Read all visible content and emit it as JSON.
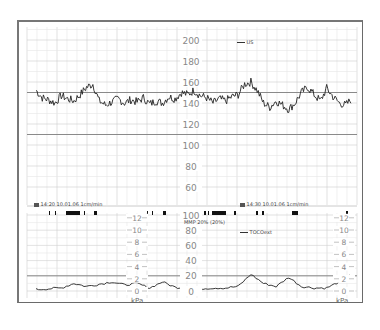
{
  "window": {
    "title": "CTG trace"
  },
  "upper_panel": {
    "legend_label": "US",
    "scale_labels": [
      "200",
      "180",
      "160",
      "140",
      "120",
      "100",
      "80",
      "60"
    ],
    "reference_lines": [
      150,
      110
    ]
  },
  "lower_panel": {
    "header_left": "14:20 10.01.06 1cm/min",
    "header_right": "14:30 10.01.06 1cm/min",
    "annotation": "MMP 20% (20%)",
    "legend_label": "TOCOext",
    "toco_scale_labels": [
      "100",
      "80",
      "60",
      "40",
      "20",
      "0"
    ],
    "kpa_scale_labels": [
      "12",
      "10",
      "8",
      "6",
      "4",
      "2",
      "0"
    ],
    "kpa_unit": "kPa",
    "reference_line": 20
  },
  "chart_data": [
    {
      "type": "line",
      "title": "Fetal heart rate (US)",
      "ylabel": "bpm",
      "xlabel": "time",
      "ylim": [
        50,
        210
      ],
      "grid": true,
      "legend": [
        "US"
      ],
      "x_labels": [
        "14:20",
        "14:30"
      ],
      "reference_lines": [
        150,
        110
      ],
      "series": [
        {
          "name": "US",
          "x": [
            0,
            2,
            4,
            6,
            8,
            10,
            12,
            14,
            16,
            18,
            20,
            22,
            24,
            26,
            28,
            30,
            32,
            34,
            36,
            38,
            40,
            42,
            44,
            46,
            48,
            50,
            52,
            54,
            56,
            58,
            60,
            62,
            64,
            66,
            68,
            70,
            72,
            74,
            76,
            78,
            80,
            82,
            84,
            86,
            88,
            90,
            92,
            94,
            96,
            98,
            100
          ],
          "values": [
            152,
            145,
            143,
            140,
            147,
            144,
            142,
            148,
            155,
            158,
            142,
            138,
            141,
            144,
            140,
            143,
            141,
            145,
            139,
            142,
            140,
            146,
            144,
            150,
            148,
            152,
            147,
            145,
            140,
            144,
            142,
            146,
            148,
            158,
            160,
            152,
            140,
            136,
            142,
            138,
            134,
            140,
            150,
            155,
            148,
            142,
            154,
            146,
            140,
            138,
            144
          ]
        }
      ]
    },
    {
      "type": "line",
      "title": "Uterine activity (TOCOext)",
      "ylabel": "",
      "ylim": [
        0,
        100
      ],
      "secondary_ylabel": "kPa",
      "secondary_ylim": [
        0,
        12
      ],
      "grid": true,
      "legend": [
        "TOCOext"
      ],
      "annotations": [
        "MMP 20% (20%)"
      ],
      "reference_lines": [
        20
      ],
      "series": [
        {
          "name": "TOCOext",
          "x": [
            0,
            4,
            8,
            12,
            16,
            20,
            24,
            28,
            32,
            36,
            40,
            44,
            48,
            52,
            56,
            60,
            64,
            68,
            72,
            76,
            80,
            84,
            88,
            92,
            96,
            100
          ],
          "values": [
            2,
            3,
            4,
            10,
            6,
            9,
            12,
            8,
            10,
            4,
            12,
            5,
            4,
            3,
            4,
            4,
            6,
            22,
            10,
            6,
            18,
            6,
            4,
            4,
            12,
            24
          ]
        }
      ]
    }
  ]
}
